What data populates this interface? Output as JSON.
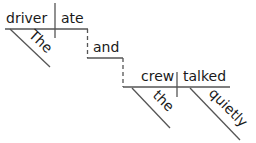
{
  "diagram": {
    "type": "Reed-Kellogg sentence diagram",
    "sentence": "The driver ate and the crew talked quietly",
    "colors": {
      "line": "#555555",
      "text": "#1a1a1a",
      "background": "#ffffff"
    },
    "clause1": {
      "subject": "driver",
      "verb": "ate",
      "modifiers": [
        {
          "word": "The",
          "modifies": "driver"
        }
      ]
    },
    "conjunction": "and",
    "clause2": {
      "subject": "crew",
      "verb": "talked",
      "modifiers": [
        {
          "word": "the",
          "modifies": "crew"
        },
        {
          "word": "quietly",
          "modifies": "talked"
        }
      ]
    }
  }
}
